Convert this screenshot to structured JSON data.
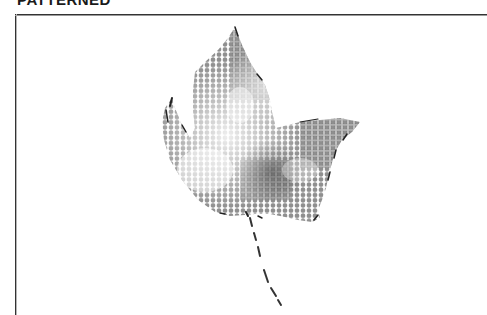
{
  "title": "PATTERNED",
  "image": {
    "subject": "leaf-illustration",
    "style": "halftone-dot-pattern",
    "colors": {
      "dot_dark": "#555555",
      "dot_mid": "#8c8c8c",
      "dot_light": "#c8c8c8",
      "edge": "#222222",
      "background": "#ffffff",
      "frame": "#333333"
    }
  }
}
